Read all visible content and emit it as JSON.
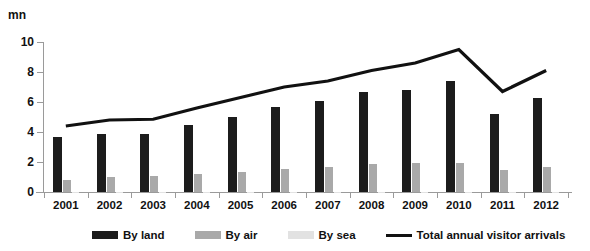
{
  "top_clipped_text": "",
  "unit_label": "mn",
  "axis": {
    "y_ticks": [
      0,
      2,
      4,
      6,
      8,
      10
    ],
    "y_min": 0,
    "y_max": 10
  },
  "legend": {
    "items": [
      {
        "label": "By land",
        "color": "#1c1c1c",
        "kind": "bar"
      },
      {
        "label": "By air",
        "color": "#a9a9a9",
        "kind": "bar"
      },
      {
        "label": "By sea",
        "color": "#e2e2e2",
        "kind": "bar"
      },
      {
        "label": "Total annual visitor arrivals",
        "color": "#111111",
        "kind": "line"
      }
    ]
  },
  "chart_data": {
    "type": "bar",
    "title": "",
    "xlabel": "",
    "ylabel": "mn",
    "ylim": [
      0,
      10
    ],
    "grid": false,
    "legend_position": "bottom",
    "categories": [
      "2001",
      "2002",
      "2003",
      "2004",
      "2005",
      "2006",
      "2007",
      "2008",
      "2009",
      "2010",
      "2011",
      "2012"
    ],
    "series": [
      {
        "name": "By land",
        "type": "bar",
        "color": "#1c1c1c",
        "values": [
          3.7,
          3.9,
          3.9,
          4.5,
          5.0,
          5.7,
          6.1,
          6.7,
          6.8,
          7.4,
          5.2,
          6.3
        ]
      },
      {
        "name": "By air",
        "type": "bar",
        "color": "#a9a9a9",
        "values": [
          0.8,
          1.0,
          1.05,
          1.2,
          1.35,
          1.55,
          1.7,
          1.9,
          1.95,
          1.95,
          1.5,
          1.7
        ]
      },
      {
        "name": "By sea",
        "type": "bar",
        "color": "#e2e2e2",
        "values": [
          0.02,
          0.02,
          0.02,
          0.02,
          0.02,
          0.02,
          0.02,
          0.02,
          0.02,
          0.02,
          0.02,
          0.02
        ]
      },
      {
        "name": "Total annual visitor arrivals",
        "type": "line",
        "color": "#111111",
        "values": [
          4.4,
          4.8,
          4.85,
          5.6,
          6.3,
          7.0,
          7.4,
          8.1,
          8.6,
          9.5,
          6.7,
          8.1
        ]
      }
    ]
  }
}
